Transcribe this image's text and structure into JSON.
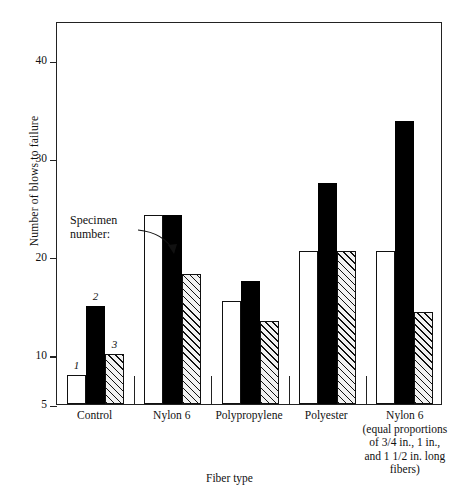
{
  "chart_data": {
    "type": "bar",
    "title": "",
    "xlabel": "Fiber type",
    "ylabel": "Number of blows to failure",
    "categories": [
      "Control",
      "Nylon 6",
      "Polypropylene",
      "Polyester",
      "Nylon 6\n(equal proportions\nof 3/4 in., 1 in.,\nand 1 1/2 in. long\nfibers)"
    ],
    "category_lines": [
      [
        "Control"
      ],
      [
        "Nylon 6"
      ],
      [
        "Polypropylene"
      ],
      [
        "Polyester"
      ],
      [
        "Nylon 6",
        "(equal proportions",
        "of 3/4 in., 1 in.,",
        "and 1 1/2 in. long",
        "fibers)"
      ]
    ],
    "series": [
      {
        "name": "1",
        "style": "white",
        "values": [
          8.0,
          24.2,
          15.5,
          20.6,
          20.6
        ]
      },
      {
        "name": "2",
        "style": "black",
        "values": [
          15.0,
          24.2,
          17.5,
          27.5,
          33.8
        ]
      },
      {
        "name": "3",
        "style": "hatched",
        "values": [
          10.1,
          18.2,
          13.5,
          20.6,
          14.4
        ]
      }
    ],
    "ylim": [
      5,
      44
    ],
    "yticks": [
      5,
      10,
      20,
      30,
      40
    ],
    "ytick_labels": [
      "5",
      "10",
      "20",
      "30",
      "40"
    ],
    "grid": false,
    "legend_position": "none",
    "annotation": {
      "line1": "Specimen",
      "line2": "number:",
      "arrow": "curved-arrow-pointing-right-down"
    },
    "bar_labels_shown_on_group": "Control",
    "bar_labels": [
      "1",
      "2",
      "3"
    ],
    "colors": {
      "bar_white": "#ffffff",
      "bar_black": "#000000",
      "bar_hatch_fill": "#f2f2f2",
      "bar_hatch_line": "#111111",
      "axis": "#222222",
      "text": "#111111"
    }
  }
}
